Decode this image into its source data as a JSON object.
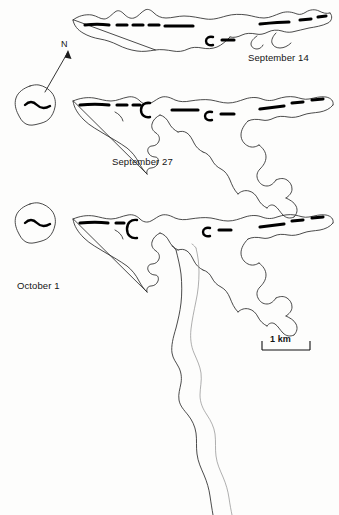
{
  "figure": {
    "type": "map-series",
    "background_color": "#fdfdfc",
    "outline_color": "#2a2a2a",
    "lead_color": "#000000",
    "faint_outline_color": "#8d8d8d"
  },
  "panels": [
    {
      "id": "sept14",
      "date_label": "September 14"
    },
    {
      "id": "sept27",
      "date_label": "September 27"
    },
    {
      "id": "oct1",
      "date_label": "October 1"
    }
  ],
  "north_arrow": {
    "label": "N",
    "icon": "north-arrow-icon",
    "direction": "up-right"
  },
  "scale_bar": {
    "label": "1 km",
    "length_km": 1,
    "style": "bracket-with-end-ticks"
  }
}
